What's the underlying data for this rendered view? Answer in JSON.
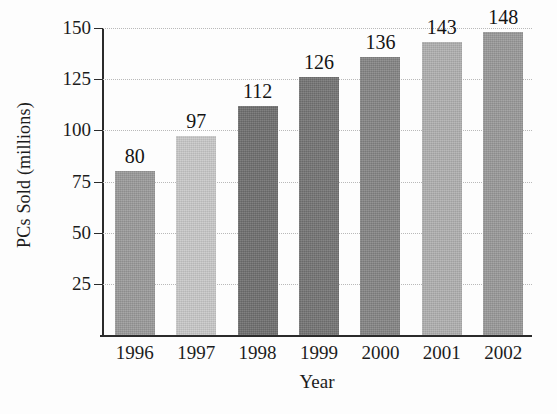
{
  "chart_data": {
    "type": "bar",
    "title": "",
    "xlabel": "Year",
    "ylabel": "PCs Sold (millions)",
    "categories": [
      "1996",
      "1997",
      "1998",
      "1999",
      "2000",
      "2001",
      "2002"
    ],
    "values": [
      80,
      97,
      112,
      126,
      136,
      143,
      148
    ],
    "value_labels": [
      "80",
      "97",
      "112",
      "126",
      "136",
      "143",
      "148"
    ],
    "ylim": [
      0,
      150
    ],
    "yticks": [
      25,
      50,
      75,
      100,
      125,
      150
    ],
    "ytick_labels": [
      "25",
      "50",
      "75",
      "100",
      "125",
      "150"
    ],
    "grid": true,
    "grid_style": "dotted",
    "legend": false,
    "bar_colors": [
      "#9a9a9a",
      "#c9c9c9",
      "#6f6f6f",
      "#747474",
      "#858585",
      "#b0b0b0",
      "#999999"
    ],
    "axis_color": "#2b2b2b",
    "gridline_color": "#b9b9b9",
    "background_color": "#fdfdfd",
    "text_color": "#1c1c1c"
  }
}
